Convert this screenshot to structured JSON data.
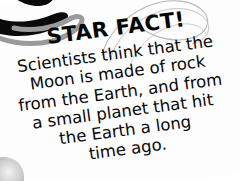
{
  "card": {
    "headline": "STAR FACT!",
    "body_lines": [
      "Scientists think that the",
      "Moon is made of rock",
      "from the Earth, and from",
      "a small planet that hit",
      "the Earth a long",
      "time ago."
    ],
    "full_text": "Scientists think that the Moon is made of rock from the Earth, and from a small planet that hit the Earth a long time ago."
  },
  "decorations": {
    "swirl_blob": "swirl-blob-icon",
    "arc_top_right": "corner-arc-icon",
    "arc_bottom_right": "corner-arc-icon",
    "dot_bottom_left": "circle-dot-icon",
    "loop_lines": "loop-lines-icon"
  },
  "colors": {
    "background": "#ffffff",
    "card": "#fdfdfd",
    "text": "#080808",
    "headline": "#050505",
    "decoration_dark": "#0a0a0a",
    "decoration_gray": "#8e8e8e"
  }
}
